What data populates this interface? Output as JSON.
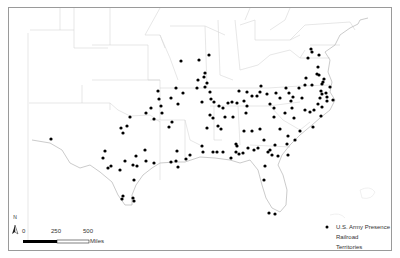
{
  "map": {
    "frame_color": "#9a9a9a",
    "boundary_color": "#d6d6d6",
    "coast_color": "#b5b5b5",
    "dot_color": "#000000"
  },
  "legend": {
    "items": [
      {
        "label": "U.S. Army Presence",
        "symbol": "dot"
      },
      {
        "label": "Railroad",
        "symbol": "line"
      },
      {
        "label": "Territories",
        "symbol": "polygon"
      }
    ]
  },
  "scale_bar": {
    "ticks": [
      "0",
      "250",
      "500"
    ],
    "unit": "Miles"
  },
  "north_arrow": {
    "label": "N"
  },
  "points": [
    [
      181,
      61
    ],
    [
      199,
      60
    ],
    [
      209,
      55
    ],
    [
      198,
      80
    ],
    [
      204,
      77
    ],
    [
      205,
      73
    ],
    [
      197,
      88
    ],
    [
      176,
      88
    ],
    [
      183,
      93
    ],
    [
      159,
      99
    ],
    [
      158,
      91
    ],
    [
      171,
      98
    ],
    [
      161,
      106
    ],
    [
      162,
      113
    ],
    [
      178,
      104
    ],
    [
      172,
      122
    ],
    [
      169,
      127
    ],
    [
      154,
      119
    ],
    [
      151,
      108
    ],
    [
      146,
      113
    ],
    [
      205,
      87
    ],
    [
      207,
      83
    ],
    [
      210,
      92
    ],
    [
      211,
      99
    ],
    [
      202,
      102
    ],
    [
      214,
      102
    ],
    [
      223,
      108
    ],
    [
      228,
      103
    ],
    [
      219,
      106
    ],
    [
      232,
      102
    ],
    [
      244,
      101
    ],
    [
      247,
      92
    ],
    [
      239,
      91
    ],
    [
      237,
      103
    ],
    [
      247,
      106
    ],
    [
      213,
      118
    ],
    [
      218,
      126
    ],
    [
      221,
      129
    ],
    [
      207,
      128
    ],
    [
      210,
      115
    ],
    [
      225,
      117
    ],
    [
      233,
      117
    ],
    [
      244,
      131
    ],
    [
      246,
      113
    ],
    [
      252,
      96
    ],
    [
      257,
      96
    ],
    [
      260,
      92
    ],
    [
      261,
      86
    ],
    [
      267,
      94
    ],
    [
      276,
      93
    ],
    [
      280,
      98
    ],
    [
      270,
      104
    ],
    [
      274,
      117
    ],
    [
      274,
      108
    ],
    [
      285,
      113
    ],
    [
      291,
      101
    ],
    [
      293,
      97
    ],
    [
      289,
      93
    ],
    [
      286,
      88
    ],
    [
      292,
      108
    ],
    [
      294,
      118
    ],
    [
      305,
      110
    ],
    [
      310,
      112
    ],
    [
      302,
      98
    ],
    [
      299,
      88
    ],
    [
      308,
      58
    ],
    [
      312,
      52
    ],
    [
      311,
      49
    ],
    [
      319,
      55
    ],
    [
      318,
      67
    ],
    [
      319,
      75
    ],
    [
      323,
      82
    ],
    [
      322,
      84
    ],
    [
      326,
      93
    ],
    [
      327,
      97
    ],
    [
      321,
      91
    ],
    [
      317,
      74
    ],
    [
      324,
      79
    ],
    [
      305,
      85
    ],
    [
      312,
      85
    ],
    [
      306,
      78
    ],
    [
      314,
      110
    ],
    [
      322,
      107
    ],
    [
      318,
      104
    ],
    [
      320,
      98
    ],
    [
      322,
      94
    ],
    [
      330,
      87
    ],
    [
      327,
      101
    ],
    [
      333,
      100
    ],
    [
      321,
      116
    ],
    [
      313,
      127
    ],
    [
      300,
      131
    ],
    [
      295,
      140
    ],
    [
      288,
      136
    ],
    [
      280,
      129
    ],
    [
      260,
      129
    ],
    [
      252,
      131
    ],
    [
      236,
      144
    ],
    [
      236,
      152
    ],
    [
      243,
      153
    ],
    [
      248,
      148
    ],
    [
      254,
      150
    ],
    [
      237,
      146
    ],
    [
      268,
      152
    ],
    [
      272,
      155
    ],
    [
      270,
      150
    ],
    [
      275,
      145
    ],
    [
      264,
      140
    ],
    [
      258,
      148
    ],
    [
      265,
      166
    ],
    [
      264,
      180
    ],
    [
      269,
      213
    ],
    [
      275,
      214
    ],
    [
      287,
      144
    ],
    [
      288,
      155
    ],
    [
      278,
      156
    ],
    [
      239,
      154
    ],
    [
      231,
      158
    ],
    [
      213,
      152
    ],
    [
      217,
      152
    ],
    [
      223,
      152
    ],
    [
      202,
      146
    ],
    [
      203,
      152
    ],
    [
      186,
      159
    ],
    [
      190,
      155
    ],
    [
      177,
      151
    ],
    [
      176,
      161
    ],
    [
      178,
      167
    ],
    [
      171,
      162
    ],
    [
      154,
      163
    ],
    [
      145,
      150
    ],
    [
      146,
      161
    ],
    [
      133,
      165
    ],
    [
      136,
      156
    ],
    [
      127,
      126
    ],
    [
      130,
      117
    ],
    [
      121,
      128
    ],
    [
      123,
      133
    ],
    [
      111,
      166
    ],
    [
      108,
      168
    ],
    [
      103,
      158
    ],
    [
      105,
      151
    ],
    [
      137,
      166
    ],
    [
      125,
      161
    ],
    [
      120,
      170
    ],
    [
      134,
      180
    ],
    [
      123,
      196
    ],
    [
      122,
      199
    ],
    [
      133,
      198
    ],
    [
      134,
      201
    ],
    [
      51,
      139
    ]
  ]
}
